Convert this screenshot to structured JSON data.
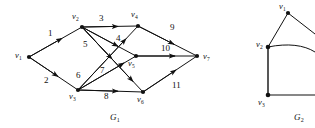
{
  "figure": {
    "background_color": "#ffffff",
    "stroke_color": "#111111",
    "text_color": "#111111"
  },
  "graphs": [
    {
      "id": "G1",
      "name": "G",
      "name_subscript": "1",
      "name_pos": {
        "x": 110,
        "y": 120
      },
      "vertices": [
        {
          "id": "v1",
          "label": "v",
          "subscript": "1",
          "x": 29,
          "y": 57,
          "label_x": 15,
          "label_y": 58
        },
        {
          "id": "v2",
          "label": "v",
          "subscript": "2",
          "x": 82,
          "y": 27,
          "label_x": 72,
          "label_y": 19
        },
        {
          "id": "v3",
          "label": "v",
          "subscript": "3",
          "x": 78,
          "y": 90,
          "label_x": 69,
          "label_y": 99
        },
        {
          "id": "v4",
          "label": "v",
          "subscript": "4",
          "x": 138,
          "y": 26,
          "label_x": 131,
          "label_y": 17
        },
        {
          "id": "v5",
          "label": "v",
          "subscript": "5",
          "x": 136,
          "y": 56,
          "label_x": 128,
          "label_y": 66
        },
        {
          "id": "v6",
          "label": "v",
          "subscript": "6",
          "x": 143,
          "y": 92,
          "label_x": 137,
          "label_y": 102
        },
        {
          "id": "v7",
          "label": "v",
          "subscript": "7",
          "x": 197,
          "y": 56,
          "label_x": 203,
          "label_y": 59
        }
      ],
      "edges": [
        {
          "from": "v1",
          "to": "v2",
          "weight": "1",
          "label_x": 48,
          "label_y": 36
        },
        {
          "from": "v1",
          "to": "v3",
          "weight": "2",
          "label_x": 44,
          "label_y": 83
        },
        {
          "from": "v2",
          "to": "v4",
          "weight": "3",
          "label_x": 99,
          "label_y": 21
        },
        {
          "from": "v2",
          "to": "v5",
          "weight": "5",
          "label_x": 83,
          "label_y": 47
        },
        {
          "from": "v2",
          "to": "v6",
          "weight": "4",
          "label_x": 116,
          "label_y": 41
        },
        {
          "from": "v3",
          "to": "v4",
          "weight": "6",
          "label_x": 76,
          "label_y": 78
        },
        {
          "from": "v3",
          "to": "v5",
          "weight": "7",
          "label_x": 100,
          "label_y": 73
        },
        {
          "from": "v3",
          "to": "v6",
          "weight": "8",
          "label_x": 104,
          "label_y": 99
        },
        {
          "from": "v4",
          "to": "v7",
          "weight": "9",
          "label_x": 170,
          "label_y": 30
        },
        {
          "from": "v5",
          "to": "v7",
          "weight": "10",
          "label_x": 161,
          "label_y": 51
        },
        {
          "from": "v6",
          "to": "v7",
          "weight": "11",
          "label_x": 172,
          "label_y": 88
        }
      ]
    },
    {
      "id": "G2",
      "name": "G",
      "name_subscript": "2",
      "name_pos": {
        "x": 296,
        "y": 120
      },
      "clipped_at_right_edge": true,
      "vertices": [
        {
          "id": "v1",
          "label": "v",
          "subscript": "1",
          "x": 288,
          "y": 13,
          "label_x": 281,
          "label_y": 8
        },
        {
          "id": "v2",
          "label": "v",
          "subscript": "2",
          "x": 268,
          "y": 47,
          "label_x": 258,
          "label_y": 46
        },
        {
          "id": "v3",
          "label": "v",
          "subscript": "3",
          "x": 268,
          "y": 95,
          "label_x": 259,
          "label_y": 104
        }
      ],
      "edges": [
        {
          "from": "v2",
          "to": "v1",
          "weight": "",
          "label_x": 0,
          "label_y": 0
        },
        {
          "from": "v2",
          "to": "v3",
          "weight": "",
          "label_x": 0,
          "label_y": 0
        },
        {
          "from": "v2",
          "to": "right_edge",
          "weight": "",
          "label_x": 0,
          "label_y": 0
        },
        {
          "from": "v3",
          "to": "right_edge",
          "weight": "",
          "label_x": 0,
          "label_y": 0
        },
        {
          "from": "v1",
          "to": "right_edge",
          "weight": "",
          "label_x": 0,
          "label_y": 0
        }
      ]
    }
  ]
}
